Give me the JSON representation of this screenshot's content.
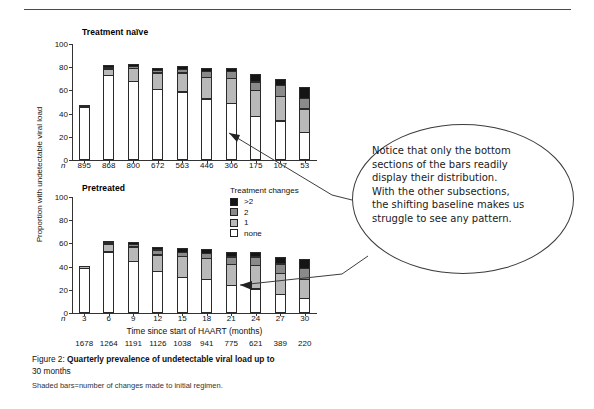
{
  "figure": {
    "ylabel": "Proportion with undetectable viral load",
    "xlabel": "Time since start of HAART (months)",
    "n_symbol": "n",
    "panels": [
      {
        "title": "Treatment naïve",
        "yticks": [
          "0",
          "20",
          "40",
          "60",
          "80",
          "100"
        ],
        "n_values": [
          "895",
          "868",
          "800",
          "672",
          "563",
          "446",
          "306",
          "175",
          "107",
          "53"
        ]
      },
      {
        "title": "Pretreated",
        "yticks": [
          "0",
          "20",
          "40",
          "60",
          "80",
          "100"
        ],
        "xticks": [
          "3",
          "6",
          "9",
          "12",
          "15",
          "18",
          "21",
          "24",
          "27",
          "30"
        ],
        "n_values": [
          "1678",
          "1264",
          "1191",
          "1126",
          "1038",
          "941",
          "775",
          "621",
          "389",
          "220"
        ]
      }
    ],
    "legend": {
      "title": "Treatment changes",
      "items": [
        {
          "label": ">2",
          "color": "#151515"
        },
        {
          "label": "2",
          "color": "#8a8a8a"
        },
        {
          "label": "1",
          "color": "#b9b9b9"
        },
        {
          "label": "none",
          "color": "#ffffff"
        }
      ]
    },
    "annotation": {
      "lines": [
        "Notice that only the bottom",
        "sections of the bars readily",
        "display their distribution.",
        "With the other subsections,",
        "the shifting baseline makes us",
        "struggle to see any pattern."
      ]
    },
    "caption": {
      "figure_number": "Figure 2:",
      "title_line1": "Quarterly prevalence of undetectable viral load up to",
      "title_line2": "30 months",
      "note": "Shaded bars=number of changes made to initial regimen."
    }
  },
  "chart_data": [
    {
      "type": "bar",
      "subtype": "stacked",
      "title": "Treatment naïve",
      "xlabel": "Time since start of HAART (months)",
      "ylabel": "Proportion with undetectable viral load",
      "ylim": [
        0,
        100
      ],
      "yticks": [
        0,
        20,
        40,
        60,
        80,
        100
      ],
      "grid": false,
      "legend_position": "center-right",
      "categories": [
        "3",
        "6",
        "9",
        "12",
        "15",
        "18",
        "21",
        "24",
        "27",
        "30"
      ],
      "n": [
        895,
        868,
        800,
        672,
        563,
        446,
        306,
        175,
        107,
        53
      ],
      "series": [
        {
          "name": "none",
          "color": "#ffffff",
          "values": [
            46,
            73,
            68,
            61,
            59,
            53,
            49,
            38,
            34,
            24
          ]
        },
        {
          "name": "1",
          "color": "#b9b9b9",
          "values": [
            2,
            6,
            12,
            15,
            17,
            19,
            22,
            23,
            22,
            21
          ]
        },
        {
          "name": "2",
          "color": "#8a8a8a",
          "values": [
            0,
            2,
            2,
            3,
            4,
            6,
            7,
            8,
            10,
            10
          ]
        },
        {
          "name": ">2",
          "color": "#151515",
          "values": [
            0,
            3,
            3,
            2,
            3,
            3,
            3,
            7,
            6,
            10
          ]
        }
      ],
      "totals": [
        48,
        84,
        85,
        81,
        83,
        81,
        81,
        76,
        72,
        65
      ]
    },
    {
      "type": "bar",
      "subtype": "stacked",
      "title": "Pretreated",
      "xlabel": "Time since start of HAART (months)",
      "ylabel": "Proportion with undetectable viral load",
      "ylim": [
        0,
        100
      ],
      "yticks": [
        0,
        20,
        40,
        60,
        80,
        100
      ],
      "grid": false,
      "legend_position": "center-right",
      "categories": [
        "3",
        "6",
        "9",
        "12",
        "15",
        "18",
        "21",
        "24",
        "27",
        "30"
      ],
      "n": [
        1678,
        1264,
        1191,
        1126,
        1038,
        941,
        775,
        621,
        389,
        220
      ],
      "series": [
        {
          "name": "none",
          "color": "#ffffff",
          "values": [
            39,
            53,
            45,
            36,
            31,
            29,
            24,
            21,
            16,
            13
          ]
        },
        {
          "name": "1",
          "color": "#b9b9b9",
          "values": [
            2,
            7,
            13,
            15,
            19,
            19,
            19,
            21,
            19,
            17
          ]
        },
        {
          "name": "2",
          "color": "#8a8a8a",
          "values": [
            0,
            2,
            3,
            5,
            4,
            5,
            7,
            8,
            9,
            10
          ]
        },
        {
          "name": ">2",
          "color": "#151515",
          "values": [
            0,
            2,
            2,
            3,
            4,
            4,
            5,
            5,
            6,
            9
          ]
        }
      ],
      "totals": [
        41,
        64,
        63,
        59,
        58,
        57,
        55,
        55,
        50,
        49
      ]
    }
  ]
}
